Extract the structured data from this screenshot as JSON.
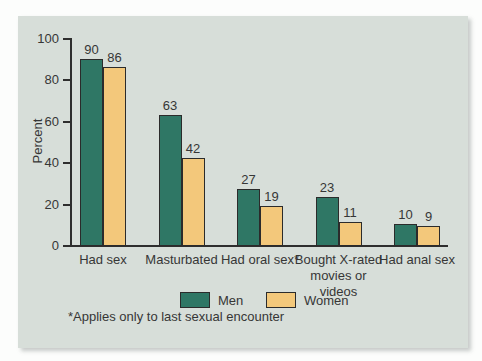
{
  "chart_data": {
    "type": "bar",
    "categories": [
      "Had sex",
      "Masturbated",
      "Had oral sex*",
      "Bought X-rated movies or videos",
      "Had anal sex"
    ],
    "series": [
      {
        "name": "Men",
        "color": "#2f7765",
        "values": [
          90,
          63,
          27,
          23,
          10
        ]
      },
      {
        "name": "Women",
        "color": "#f3c87b",
        "values": [
          86,
          42,
          19,
          11,
          9
        ]
      }
    ],
    "value_labels_shown": true,
    "ylabel": "Percent",
    "ylim": [
      0,
      100
    ],
    "yticks": [
      0,
      20,
      40,
      60,
      80,
      100
    ],
    "grid": "off",
    "legend_position": "bottom-center",
    "footnote": "*Applies only to last sexual encounter"
  },
  "colors": {
    "page_background": "#fcfdfc",
    "panel_background": "#d7ded9",
    "men_bar": "#2f7765",
    "women_bar": "#f3c87b",
    "bar_outline": "#2b2b2b",
    "axis": "#2e2e2e",
    "text": "#363636"
  }
}
